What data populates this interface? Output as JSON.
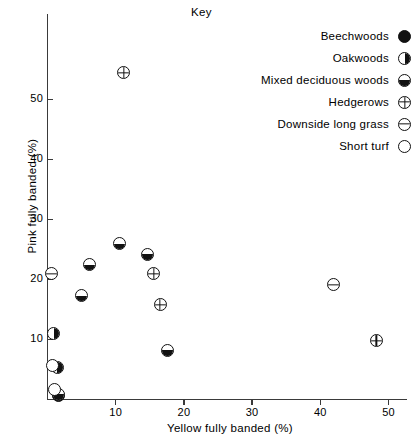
{
  "chart_data": {
    "type": "scatter",
    "title": "",
    "xlabel": "Yellow fully banded (%)",
    "ylabel": "Pink fully banded (%)",
    "xlim": [
      0,
      53
    ],
    "ylim": [
      0,
      57
    ],
    "xticks": [
      10,
      20,
      30,
      40,
      50
    ],
    "yticks": [
      10,
      20,
      30,
      40,
      50
    ],
    "grid": false,
    "legend_position": "top-right",
    "legend_title": "Key",
    "series": [
      {
        "name": "Beechwoods",
        "symbol": "filled-circle",
        "points": [
          [
            1.6,
            0.7
          ]
        ]
      },
      {
        "name": "Oakwoods",
        "symbol": "right-half-filled-circle",
        "points": [
          [
            0.9,
            11.0
          ],
          [
            1.4,
            5.4
          ]
        ]
      },
      {
        "name": "Mixed deciduous woods",
        "symbol": "bottom-half-filled-circle",
        "points": [
          [
            5.0,
            17.3
          ],
          [
            6.2,
            22.5
          ],
          [
            10.6,
            26.0
          ],
          [
            14.6,
            24.2
          ],
          [
            17.6,
            8.2
          ],
          [
            1.6,
            0.9
          ]
        ]
      },
      {
        "name": "Hedgerows",
        "symbol": "circle-with-cross",
        "points": [
          [
            11.2,
            54.5
          ],
          [
            15.6,
            21.0
          ],
          [
            16.5,
            15.8
          ],
          [
            48.2,
            9.8
          ]
        ]
      },
      {
        "name": "Downside long grass",
        "symbol": "circle-with-horizontal-bar",
        "points": [
          [
            0.6,
            21.0
          ],
          [
            42.0,
            19.1
          ]
        ]
      },
      {
        "name": "Short turf",
        "symbol": "open-circle",
        "points": [
          [
            0.7,
            5.6
          ],
          [
            1.0,
            1.7
          ]
        ]
      }
    ]
  },
  "axes": {
    "x_tick_labels": [
      "10",
      "20",
      "30",
      "40",
      "50"
    ],
    "y_tick_labels": [
      "10",
      "20",
      "30",
      "40",
      "50"
    ],
    "x_title": "Yellow fully banded (%)",
    "y_title": "Pink fully banded (%)"
  },
  "key": {
    "title": "Key",
    "items": [
      {
        "label": "Beechwoods",
        "symbol": "filled-circle"
      },
      {
        "label": "Oakwoods",
        "symbol": "right-half-filled-circle"
      },
      {
        "label": "Mixed deciduous woods",
        "symbol": "bottom-half-filled-circle"
      },
      {
        "label": "Hedgerows",
        "symbol": "circle-with-cross"
      },
      {
        "label": "Downside long grass",
        "symbol": "circle-with-horizontal-bar"
      },
      {
        "label": "Short turf",
        "symbol": "open-circle"
      }
    ]
  },
  "colors": {
    "ink": "#111111",
    "axis": "#3a3a3a",
    "background": "#ffffff"
  }
}
